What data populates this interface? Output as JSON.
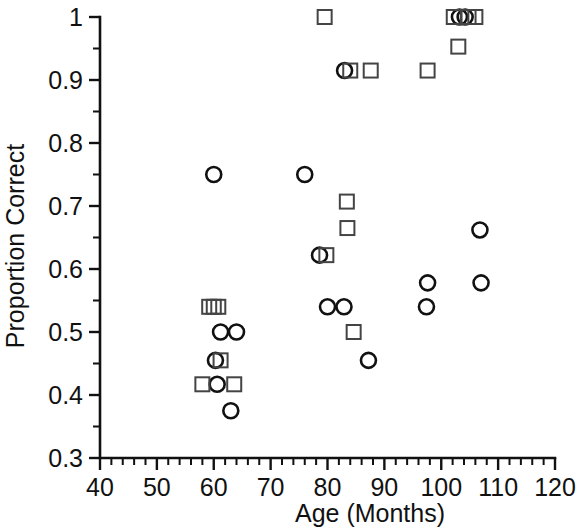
{
  "chart_data": {
    "type": "scatter",
    "title": "",
    "xlabel": "Age (Months)",
    "ylabel": "Proportion Correct",
    "xlim": [
      40,
      120
    ],
    "ylim": [
      0.3,
      1.0
    ],
    "xticks": [
      40,
      50,
      60,
      70,
      80,
      90,
      100,
      110,
      120
    ],
    "xtick_labels": [
      "40",
      "50",
      "60",
      "70",
      "80",
      "90",
      "100",
      "110",
      "120"
    ],
    "x_minor_per_major": 5,
    "yticks": [
      0.3,
      0.4,
      0.5,
      0.6,
      0.7,
      0.8,
      0.9,
      1.0
    ],
    "ytick_labels": [
      "0.3",
      "0.4",
      "0.5",
      "0.6",
      "0.7",
      "0.8",
      "0.9",
      "1"
    ],
    "y_minor_per_major": 2,
    "grid": false,
    "legend": null,
    "marker_colors": {
      "circle": "#111111",
      "square": "#444444"
    },
    "series": [
      {
        "name": "circle",
        "marker": "circle",
        "points": [
          [
            60.0,
            0.75
          ],
          [
            60.3,
            0.455
          ],
          [
            60.6,
            0.417
          ],
          [
            61.2,
            0.5
          ],
          [
            63.0,
            0.375
          ],
          [
            64.0,
            0.5
          ],
          [
            76.0,
            0.75
          ],
          [
            78.6,
            0.622
          ],
          [
            80.0,
            0.54
          ],
          [
            82.9,
            0.54
          ],
          [
            83.0,
            0.915
          ],
          [
            87.2,
            0.455
          ],
          [
            97.4,
            0.54
          ],
          [
            97.6,
            0.578
          ],
          [
            103.2,
            1.0
          ],
          [
            104.2,
            1.0
          ],
          [
            106.8,
            0.662
          ],
          [
            107.0,
            0.578
          ]
        ]
      },
      {
        "name": "square",
        "marker": "square",
        "points": [
          [
            58.0,
            0.417
          ],
          [
            59.2,
            0.54
          ],
          [
            60.0,
            0.54
          ],
          [
            60.8,
            0.54
          ],
          [
            61.2,
            0.455
          ],
          [
            63.6,
            0.417
          ],
          [
            79.5,
            1.0
          ],
          [
            79.8,
            0.622
          ],
          [
            83.4,
            0.707
          ],
          [
            83.5,
            0.665
          ],
          [
            84.6,
            0.5
          ],
          [
            84.0,
            0.915
          ],
          [
            87.6,
            0.915
          ],
          [
            97.6,
            0.915
          ],
          [
            102.2,
            1.0
          ],
          [
            103.0,
            0.953
          ],
          [
            104.8,
            1.0
          ],
          [
            106.0,
            1.0
          ]
        ]
      }
    ]
  },
  "axes": {
    "x_axis_title": "Age (Months)",
    "y_axis_title": "Proportion Correct"
  }
}
